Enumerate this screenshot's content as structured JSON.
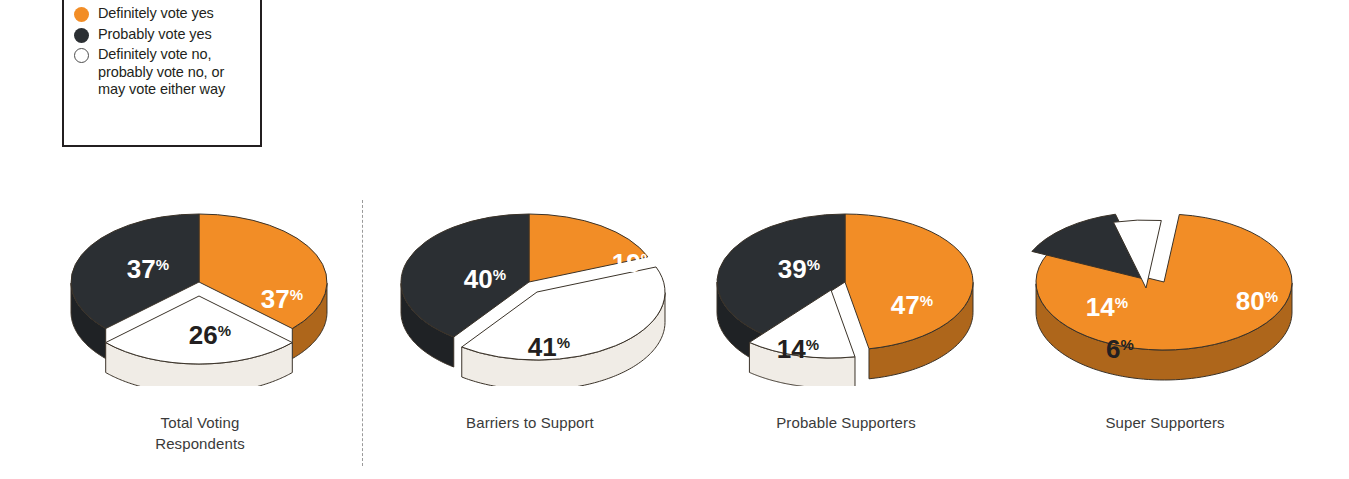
{
  "legend": {
    "items": [
      {
        "marker": "orange-dot-icon",
        "color": "#F28D26",
        "label": "Definitely vote yes"
      },
      {
        "marker": "dark-dot-icon",
        "color": "#2B2F33",
        "label": "Probably vote yes"
      },
      {
        "marker": "white-dot-icon",
        "color": "#FFFFFF",
        "label": "Definitely vote no,\nprobably vote no, or\nmay vote either way"
      }
    ]
  },
  "chart_data": {
    "type": "pie",
    "title": "",
    "legend": [
      "Definitely vote yes",
      "Probably vote yes",
      "Definitely vote no, probably vote no, or may vote either way"
    ],
    "legend_position": "top-left",
    "colors": {
      "definitely_yes": "#F28D26",
      "probably_yes": "#2B2F33",
      "no_or_maybe": "#FFFFFF"
    },
    "unit": "%",
    "charts": [
      {
        "name": "Total Voting Respondents",
        "caption": "Total Voting\nRespondents",
        "slices": [
          {
            "label": "Definitely vote yes",
            "value": 37,
            "display": "37",
            "suffix": "%",
            "color": "#F28D26"
          },
          {
            "label": "Probably vote yes",
            "value": 37,
            "display": "37",
            "suffix": "%",
            "color": "#2B2F33"
          },
          {
            "label": "Definitely vote no, probably vote no, or may vote either way",
            "value": 26,
            "display": "26",
            "suffix": "%",
            "color": "#FFFFFF",
            "exploded": true
          }
        ]
      },
      {
        "name": "Barriers to Support",
        "caption": "Barriers to Support",
        "slices": [
          {
            "label": "Definitely vote yes",
            "value": 19,
            "display": "19",
            "suffix": "%",
            "color": "#F28D26"
          },
          {
            "label": "Probably vote yes",
            "value": 40,
            "display": "40",
            "suffix": "%",
            "color": "#2B2F33"
          },
          {
            "label": "Definitely vote no, probably vote no, or may vote either way",
            "value": 41,
            "display": "41",
            "suffix": "%",
            "color": "#FFFFFF",
            "exploded": true
          }
        ]
      },
      {
        "name": "Probable Supporters",
        "caption": "Probable Supporters",
        "slices": [
          {
            "label": "Definitely vote yes",
            "value": 47,
            "display": "47",
            "suffix": "%",
            "color": "#F28D26"
          },
          {
            "label": "Probably vote yes",
            "value": 39,
            "display": "39",
            "suffix": "%",
            "color": "#2B2F33"
          },
          {
            "label": "Definitely vote no, probably vote no, or may vote either way",
            "value": 14,
            "display": "14",
            "suffix": "%",
            "color": "#FFFFFF",
            "exploded": true
          }
        ]
      },
      {
        "name": "Super Supporters",
        "caption": "Super Supporters",
        "slices": [
          {
            "label": "Definitely vote yes",
            "value": 80,
            "display": "80",
            "suffix": "%",
            "color": "#F28D26"
          },
          {
            "label": "Probably vote yes",
            "value": 14,
            "display": "14",
            "suffix": "%",
            "color": "#2B2F33",
            "exploded": true
          },
          {
            "label": "Definitely vote no, probably vote no, or may vote either way",
            "value": 6,
            "display": "6",
            "suffix": "%",
            "color": "#FFFFFF",
            "exploded": true
          }
        ]
      }
    ]
  }
}
